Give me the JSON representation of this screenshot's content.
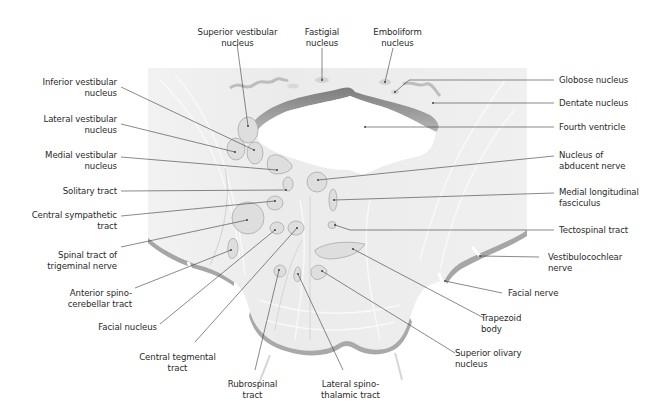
{
  "figure": {
    "colors": {
      "background": "#ffffff",
      "tissue": "#ececec",
      "tissue_light": "#f5f5f5",
      "edge_shadow": "#9a9a9a",
      "nucleus_fill": "#dcdcdc",
      "nucleus_stroke": "#a8a8a8",
      "leader_line": "#3a3a3a",
      "text": "#2a2a2a"
    }
  },
  "labels": {
    "top": [
      {
        "id": "superior-vestibular-nucleus",
        "lines": [
          "Superior vestibular",
          "nucleus"
        ]
      },
      {
        "id": "fastigial-nucleus",
        "lines": [
          "Fastigial",
          "nucleus"
        ]
      },
      {
        "id": "emboliform-nucleus",
        "lines": [
          "Emboliform",
          "nucleus"
        ]
      }
    ],
    "left": [
      {
        "id": "inferior-vestibular-nucleus",
        "lines": [
          "Inferior vestibular",
          "nucleus"
        ]
      },
      {
        "id": "lateral-vestibular-nucleus",
        "lines": [
          "Lateral vestibular",
          "nucleus"
        ]
      },
      {
        "id": "medial-vestibular-nucleus",
        "lines": [
          "Medial vestibular",
          "nucleus"
        ]
      },
      {
        "id": "solitary-tract",
        "lines": [
          "Solitary tract"
        ]
      },
      {
        "id": "central-sympathetic-tract",
        "lines": [
          "Central sympathetic",
          "tract"
        ]
      },
      {
        "id": "spinal-tract-of-trigeminal-nerve",
        "lines": [
          "Spinal tract of",
          "trigeminal nerve"
        ]
      },
      {
        "id": "anterior-spinocerebellar-tract",
        "lines": [
          "Anterior spino-",
          "cerebellar tract"
        ]
      },
      {
        "id": "facial-nucleus",
        "lines": [
          "Facial nucleus"
        ]
      }
    ],
    "bottom": [
      {
        "id": "central-tegmental-tract",
        "lines": [
          "Central tegmental",
          "tract"
        ]
      },
      {
        "id": "rubrospinal-tract",
        "lines": [
          "Rubrospinal",
          "tract"
        ]
      },
      {
        "id": "lateral-spinothalamic-tract",
        "lines": [
          "Lateral spino-",
          "thalamic tract"
        ]
      }
    ],
    "right": [
      {
        "id": "globose-nucleus",
        "lines": [
          "Globose nucleus"
        ]
      },
      {
        "id": "dentate-nucleus",
        "lines": [
          "Dentate nucleus"
        ]
      },
      {
        "id": "fourth-ventricle",
        "lines": [
          "Fourth ventricle"
        ]
      },
      {
        "id": "nucleus-of-abducent-nerve",
        "lines": [
          "Nucleus of",
          "abducent nerve"
        ]
      },
      {
        "id": "medial-longitudinal-fasciculus",
        "lines": [
          "Medial longitudinal",
          "fasciculus"
        ]
      },
      {
        "id": "tectospinal-tract",
        "lines": [
          "Tectospinal tract"
        ]
      },
      {
        "id": "vestibulocochlear-nerve",
        "lines": [
          "Vestibulocochlear",
          "nerve"
        ]
      },
      {
        "id": "facial-nerve",
        "lines": [
          "Facial nerve"
        ]
      },
      {
        "id": "trapezoid-body",
        "lines": [
          "Trapezoid",
          "body"
        ]
      },
      {
        "id": "superior-olivary-nucleus",
        "lines": [
          "Superior olivary",
          "nucleus"
        ]
      }
    ]
  }
}
